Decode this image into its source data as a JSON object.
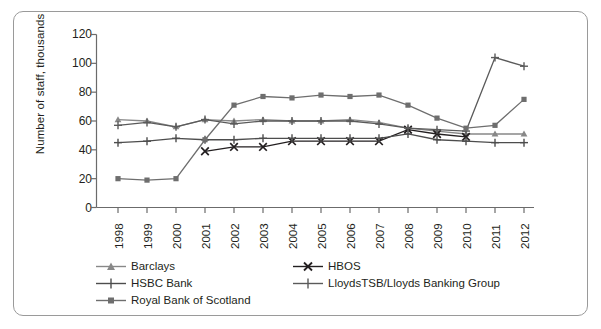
{
  "chart_data": {
    "type": "line",
    "title": "",
    "xlabel": "",
    "ylabel": "Number of staff, thousands",
    "categories": [
      "1998",
      "1999",
      "2000",
      "2001",
      "2002",
      "2003",
      "2004",
      "2005",
      "2006",
      "2007",
      "2008",
      "2009",
      "2010",
      "2011",
      "2012"
    ],
    "ylim": [
      0,
      120
    ],
    "yticks": [
      0,
      20,
      40,
      60,
      80,
      100,
      120
    ],
    "grid": false,
    "legend_position": "bottom-left",
    "series": [
      {
        "name": "Barclays",
        "marker": "triangle",
        "color": "#888888",
        "values": [
          61,
          60,
          56,
          61,
          60,
          61,
          60,
          60,
          61,
          59,
          55,
          53,
          51,
          51,
          51
        ]
      },
      {
        "name": "HBOS",
        "marker": "cross-x",
        "color": "#231f20",
        "values": [
          null,
          null,
          null,
          39,
          42,
          42,
          46,
          46,
          46,
          46,
          54,
          51,
          49,
          null,
          null
        ]
      },
      {
        "name": "HSBC Bank",
        "marker": "plus",
        "color": "#4d4d4d",
        "values": [
          45,
          46,
          48,
          47,
          47,
          48,
          48,
          48,
          48,
          48,
          51,
          47,
          46,
          45,
          45
        ]
      },
      {
        "name": "LloydsTSB/Lloyds Banking Group",
        "marker": "plus",
        "color": "#5a5a5a",
        "values": [
          57,
          59,
          56,
          61,
          58,
          60,
          60,
          60,
          60,
          58,
          55,
          54,
          53,
          104,
          98
        ]
      },
      {
        "name": "Royal Bank of Scotland",
        "marker": "square",
        "color": "#6e6e6e",
        "values": [
          20,
          19,
          20,
          47,
          71,
          77,
          76,
          78,
          77,
          78,
          71,
          62,
          55,
          57,
          75
        ]
      }
    ]
  },
  "axis": {
    "ytick_labels": [
      "120",
      "100",
      "80",
      "60",
      "40",
      "20",
      "0"
    ],
    "xtick_labels": [
      "1998",
      "1999",
      "2000",
      "2001",
      "2002",
      "2003",
      "2004",
      "2005",
      "2006",
      "2007",
      "2008",
      "2009",
      "2010",
      "2011",
      "2012"
    ],
    "ylabel_text": "Number of staff, thousands"
  },
  "legend": {
    "rows": [
      [
        {
          "label": "Barclays",
          "marker": "triangle",
          "color": "#888888"
        },
        {
          "label": "HBOS",
          "marker": "cross-x",
          "color": "#231f20"
        }
      ],
      [
        {
          "label": "HSBC Bank",
          "marker": "plus",
          "color": "#4d4d4d"
        },
        {
          "label": "LloydsTSB/Lloyds Banking Group",
          "marker": "plus",
          "color": "#5a5a5a"
        }
      ],
      [
        {
          "label": "Royal Bank of Scotland",
          "marker": "square",
          "color": "#6e6e6e"
        }
      ]
    ]
  },
  "colors": {
    "frame_border": "#9a9a9a",
    "axis": "#6b6b6b",
    "text": "#231f20",
    "background": "#ffffff"
  }
}
